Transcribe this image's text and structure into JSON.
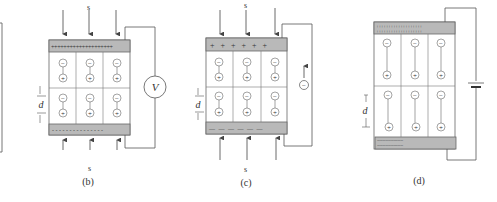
{
  "figure": {
    "panels": [
      {
        "id": "b",
        "caption": "(b)",
        "stress_label_top": "s",
        "stress_label_bottom": "s",
        "top_electrode_charges": "++++++++++++++++++++",
        "bottom_electrode_charges": "- - - - - - - - - - - - - - -",
        "dimension_label": "d",
        "meter_label": "V",
        "meter_type": "voltmeter",
        "dipole_negative": "−",
        "dipole_positive": "+"
      },
      {
        "id": "c",
        "caption": "(c)",
        "stress_label_top": "s",
        "stress_label_bottom": "s",
        "top_electrode_charges": "+ + + + + +",
        "bottom_electrode_charges": "— — — — — —",
        "dimension_label": "d",
        "circuit_element": "electron-flow",
        "carrier_label": "−",
        "dipole_negative": "−",
        "dipole_positive": "+"
      },
      {
        "id": "d",
        "caption": "(d)",
        "top_electrode_charges": "+++++++++++++++++++",
        "bottom_electrode_charges": "-------------------",
        "dimension_label": "d",
        "circuit_element": "battery",
        "dipole_negative": "−",
        "dipole_positive": "+"
      }
    ],
    "colors": {
      "electrode": "#b9b9b9",
      "line": "#555555",
      "background": "#ffffff"
    }
  }
}
